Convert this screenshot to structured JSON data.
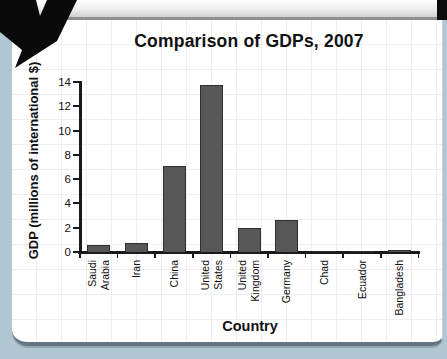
{
  "chart_data": {
    "type": "bar",
    "title": "Comparison of GDPs, 2007",
    "xlabel": "Country",
    "ylabel": "GDP (millions of international $)",
    "categories": [
      "Saudi Arabia",
      "Iran",
      "China",
      "United States",
      "United Kingdom",
      "Germany",
      "Chad",
      "Ecuador",
      "Bangladesh"
    ],
    "category_label_lines": [
      [
        "Saudi",
        "Arabia"
      ],
      [
        "Iran"
      ],
      [
        "China"
      ],
      [
        "United",
        "States"
      ],
      [
        "United",
        "Kingdom"
      ],
      [
        "Germany"
      ],
      [
        "Chad"
      ],
      [
        "Ecuador"
      ],
      [
        "Bangladesh"
      ]
    ],
    "values": [
      0.55,
      0.75,
      7.1,
      13.75,
      2.0,
      2.6,
      0.07,
      0.08,
      0.15
    ],
    "yticks": [
      0,
      2,
      4,
      6,
      8,
      10,
      12,
      14
    ],
    "ylim": [
      0,
      14
    ],
    "grid": "faint graph-paper grid on card background",
    "legend": "none",
    "bar_color": "#575757",
    "bar_border_color": "#2f2f2f"
  },
  "colors": {
    "page_background_blue": "#b0c7d3",
    "card_white": "#ffffff",
    "top_band_border_gray": "#909090",
    "card_bottom_border": "#66757f",
    "annotation_arrow_black": "#0a0a0a",
    "text_black": "#111111"
  },
  "decor": {
    "arrow_name": "black annotation arrow pointing at chart from top-left corner"
  }
}
